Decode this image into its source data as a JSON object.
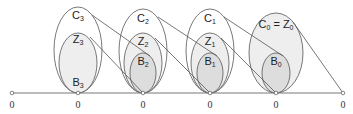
{
  "diagram": {
    "baseline_y": 93,
    "zero_label": "0",
    "zeros_x": [
      12,
      78,
      143,
      210,
      276,
      343
    ],
    "colors": {
      "stroke": "#555555",
      "fill_z": "#eeeeee",
      "fill_b": "#dddddd",
      "text": "#222222"
    },
    "groups": [
      {
        "id": "g3",
        "cx": 78,
        "C": {
          "label": "C",
          "sub": "3",
          "ry": 43,
          "rx": 24
        },
        "Z": {
          "label": "Z",
          "sub": "3",
          "ry": 30,
          "rx": 19
        },
        "B": {
          "label": "B",
          "sub": "3",
          "ry": 0,
          "rx": 0
        },
        "label_y": {
          "C": 16,
          "Z": 40,
          "B": 84
        }
      },
      {
        "id": "g2",
        "cx": 143,
        "C": {
          "label": "C",
          "sub": "2",
          "ry": 42,
          "rx": 24
        },
        "Z": {
          "label": "Z",
          "sub": "2",
          "ry": 30,
          "rx": 19
        },
        "B": {
          "label": "B",
          "sub": "2",
          "ry": 20,
          "rx": 13
        },
        "label_y": {
          "C": 18,
          "Z": 41,
          "B": 62
        }
      },
      {
        "id": "g1",
        "cx": 210,
        "C": {
          "label": "C",
          "sub": "1",
          "ry": 42,
          "rx": 24
        },
        "Z": {
          "label": "Z",
          "sub": "1",
          "ry": 30,
          "rx": 19
        },
        "B": {
          "label": "B",
          "sub": "1",
          "ry": 20,
          "rx": 13
        },
        "label_y": {
          "C": 18,
          "Z": 41,
          "B": 62
        }
      },
      {
        "id": "g0",
        "cx": 276,
        "C": {
          "label": "C",
          "sub": "0",
          "ry": 40,
          "rx": 27
        },
        "Z": {
          "label": "= Z",
          "sub": "0",
          "ry": 40,
          "rx": 27
        },
        "B": {
          "label": "B",
          "sub": "0",
          "ry": 20,
          "rx": 14
        },
        "label_y": {
          "C": 24,
          "Z": 24,
          "B": 62
        }
      }
    ],
    "labels": {
      "c3": "C",
      "c3s": "3",
      "z3": "Z",
      "z3s": "3",
      "b3": "B",
      "b3s": "3",
      "c2": "C",
      "c2s": "2",
      "z2": "Z",
      "z2s": "2",
      "b2": "B",
      "b2s": "2",
      "c1": "C",
      "c1s": "1",
      "z1": "Z",
      "z1s": "1",
      "b1": "B",
      "b1s": "1",
      "c0": "C",
      "c0s": "0",
      "eq": " = ",
      "z0": "Z",
      "z0s": "0",
      "b0": "B",
      "b0s": "0"
    }
  }
}
